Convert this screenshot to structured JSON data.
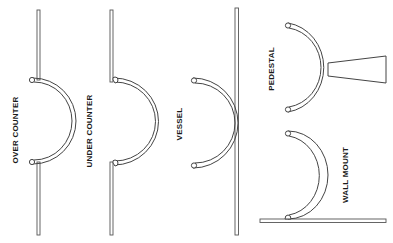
{
  "diagram": {
    "title": "",
    "background": "#ffffff",
    "line_color": "#444444",
    "sink_types": [
      {
        "id": "over-counter",
        "label": "OVER COUNTER"
      },
      {
        "id": "under-counter",
        "label": "UNDER COUNTER"
      },
      {
        "id": "vessel",
        "label": "VESSEL"
      },
      {
        "id": "pedestal",
        "label": "PEDESTAL"
      },
      {
        "id": "wall-mount",
        "label": "WALL MOUNT"
      }
    ]
  }
}
